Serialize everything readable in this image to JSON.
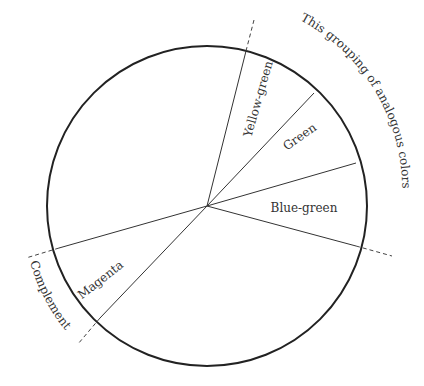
{
  "diagram": {
    "type": "color-wheel-segment-diagram",
    "wheel": {
      "cx": 207,
      "cy": 206,
      "r": 160,
      "stroke": "#222222"
    },
    "segments": [
      {
        "label": "Yellow-green",
        "x": 262,
        "y": 100,
        "rotate": -74
      },
      {
        "label": "Green",
        "x": 302,
        "y": 140,
        "rotate": -35
      },
      {
        "label": "Blue-green",
        "x": 304,
        "y": 212,
        "rotate": 0
      },
      {
        "label": "Magenta",
        "x": 103,
        "y": 283,
        "rotate": -38
      }
    ],
    "annotations": {
      "analogous": "This grouping of analogous colors",
      "complement": "Complement"
    }
  }
}
